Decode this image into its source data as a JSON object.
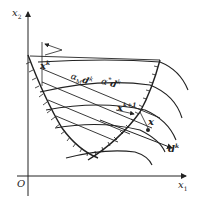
{
  "diagram": {
    "type": "feasible-direction-method",
    "axes": {
      "x_label": "x",
      "x_label_sub": "1",
      "y_label": "x",
      "y_label_sub": "2",
      "origin_label": "O"
    },
    "points": {
      "xk": {
        "base": "x",
        "sup": "k"
      },
      "xk1": {
        "base": "x",
        "sup": "k+1"
      },
      "x": {
        "base": "x"
      },
      "dk": {
        "base": "d",
        "sup": "k"
      }
    },
    "step_labels": {
      "alpha_M": {
        "alpha": "α",
        "sub": "M",
        "d": "d",
        "sup": "k"
      },
      "alpha_star": {
        "alpha": "α",
        "star": "*",
        "d": "d",
        "sup": "k"
      }
    },
    "colors": {
      "line": "#222222",
      "background": "#ffffff"
    }
  }
}
